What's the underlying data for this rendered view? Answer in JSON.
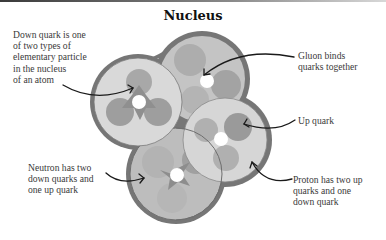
{
  "title": "Nucleus",
  "labels": {
    "down_quark": "Down quark is one\nof two types of\nelementary particle\nin the nucleus\nof an atom",
    "gluon": "Gluon binds\nquarks together",
    "up_quark": "Up quark",
    "neutron": "Neutron has two\ndown quarks and\none up quark",
    "proton": "Proton has two up\nquarks and one\ndown quark"
  },
  "colors": {
    "nucleus_outline": "#767676",
    "proton_fill": "#d9d9d9",
    "neutron_fill": "#bdbdbd",
    "up_quark": "#9d9d9d",
    "down_quark": "#a9a9a9",
    "gluon_center": "#ffffff",
    "arrow": "#1a1a1a"
  }
}
